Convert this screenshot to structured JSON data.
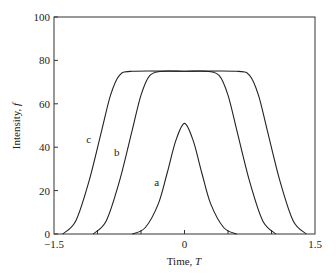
{
  "chart_data": {
    "type": "line",
    "title": "",
    "xlabel": "Time, T",
    "ylabel": "Intensity, f",
    "xlim": [
      -1.5,
      1.5
    ],
    "ylim": [
      0,
      100
    ],
    "xticks": [
      -1.5,
      0,
      1.5
    ],
    "xtick_labels": [
      "−1.5",
      "0",
      "1.5"
    ],
    "yticks": [
      0,
      20,
      40,
      60,
      80,
      100
    ],
    "ytick_labels": [
      "0",
      "20",
      "40",
      "60",
      "80",
      "100"
    ],
    "grid": false,
    "legend": "none (curves labeled inline)",
    "series": [
      {
        "name": "a",
        "label_position": {
          "x": -0.32,
          "y": 22
        },
        "x": [
          -0.6,
          -0.45,
          -0.3,
          -0.2,
          -0.1,
          0,
          0.1,
          0.2,
          0.3,
          0.45,
          0.6
        ],
        "values": [
          0,
          3,
          14,
          28,
          43,
          51,
          43,
          28,
          14,
          3,
          0
        ]
      },
      {
        "name": "b",
        "label_position": {
          "x": -0.78,
          "y": 36
        },
        "x": [
          -1.05,
          -0.9,
          -0.75,
          -0.6,
          -0.5,
          -0.4,
          -0.25,
          0,
          0.25,
          0.4,
          0.5,
          0.6,
          0.75,
          0.9,
          1.05
        ],
        "values": [
          0,
          6,
          24,
          48,
          64,
          73,
          75,
          75,
          75,
          73,
          64,
          48,
          24,
          6,
          0
        ]
      },
      {
        "name": "c",
        "label_position": {
          "x": -1.1,
          "y": 42
        },
        "x": [
          -1.4,
          -1.25,
          -1.1,
          -0.95,
          -0.85,
          -0.75,
          -0.6,
          0,
          0.6,
          0.75,
          0.85,
          0.95,
          1.1,
          1.25,
          1.4
        ],
        "values": [
          0,
          6,
          24,
          48,
          64,
          73,
          75,
          75,
          75,
          73,
          64,
          48,
          24,
          6,
          0
        ]
      }
    ]
  },
  "labels": {
    "xlabel_text": "Time, ",
    "xlabel_var": "T",
    "ylabel_text": "Intensity, ",
    "ylabel_var": "f"
  }
}
